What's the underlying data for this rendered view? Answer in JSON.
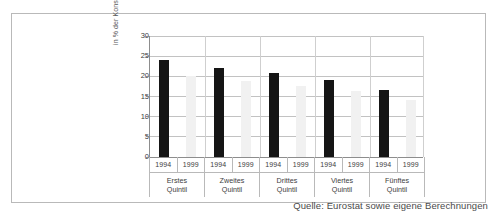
{
  "figure": {
    "source_caption": "Quelle: Eurostat sowie eigene Berechnungen"
  },
  "chart_data": {
    "type": "bar",
    "title": "",
    "subtitle": "",
    "xlabel": "",
    "ylabel": "in % der Konsumausgaben insgesamt",
    "ylim": [
      0,
      30
    ],
    "yticks": [
      0,
      5,
      10,
      15,
      20,
      25,
      30
    ],
    "ytick_labels": [
      "0",
      "5",
      "10",
      "15",
      "20",
      "25",
      "30"
    ],
    "grid": true,
    "legend": "none",
    "categories": [
      "Erstes Quintil",
      "Zweites Quintil",
      "Drittes Quintil",
      "Viertes Quintil",
      "Fünftes Quintil"
    ],
    "category_lines": [
      [
        "Erstes",
        "Quintil"
      ],
      [
        "Zweites",
        "Quintil"
      ],
      [
        "Drittes",
        "Quintil"
      ],
      [
        "Viertes",
        "Quintil"
      ],
      [
        "Fünftes",
        "Quintil"
      ]
    ],
    "series": [
      {
        "name": "1994",
        "color": "#151515",
        "values": [
          24.0,
          22.1,
          20.8,
          19.2,
          16.5
        ]
      },
      {
        "name": "1999",
        "color": "#f1f1f1",
        "values": [
          20.2,
          18.8,
          17.6,
          16.3,
          14.2
        ]
      }
    ],
    "colors": {
      "bar_1994": "#151515",
      "bar_1999": "#f1f1f1",
      "gridline": "#c2c2c2",
      "axis": "#8d8d8d",
      "frame": "#b9b9b9",
      "text": "#3d3d3d"
    }
  }
}
